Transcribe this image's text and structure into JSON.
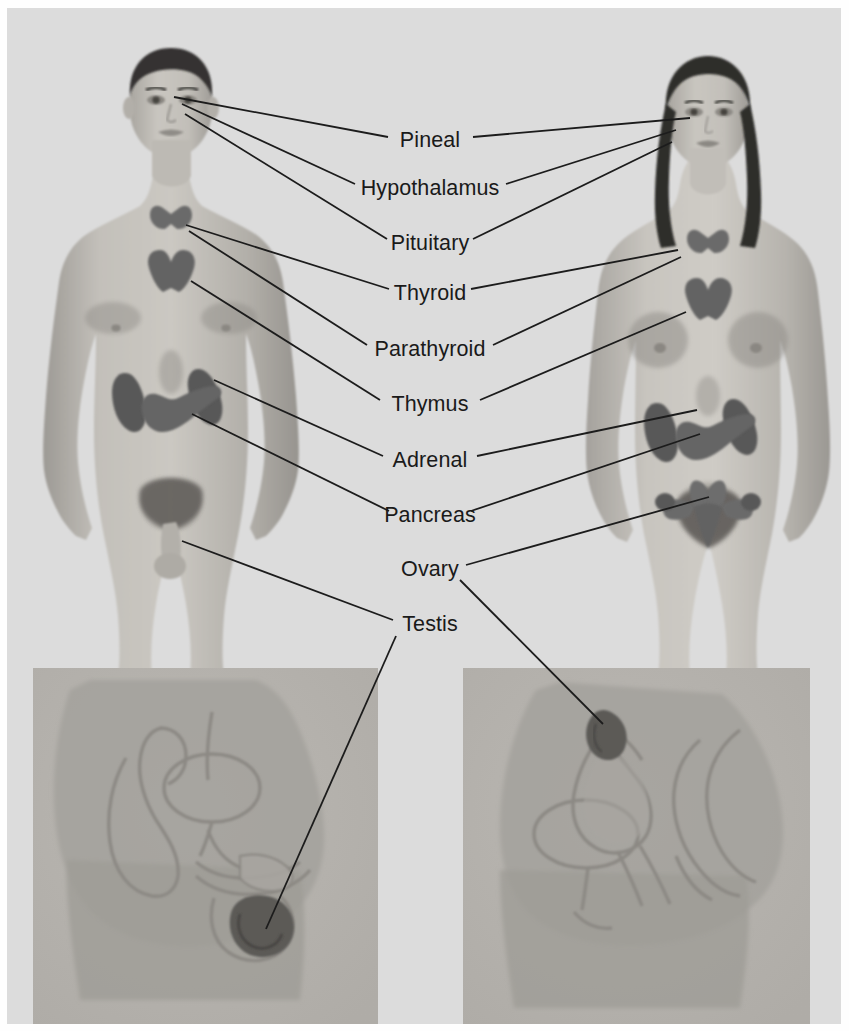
{
  "diagram": {
    "background_color": "#dcdcdc",
    "page_color": "#fefefe",
    "label_color": "#1a1a1a",
    "leader_line_color": "#1c1c1c",
    "organ_color": "#6a6a6a",
    "skin_color": "#b9b6b1",
    "inset_panel_color": "#b6b4b0",
    "hair_color": "#333230"
  },
  "labels": [
    {
      "id": "pineal",
      "text": "Pineal",
      "cx": 430,
      "cy": 141
    },
    {
      "id": "hypothalamus",
      "text": "Hypothalamus",
      "cx": 430,
      "cy": 189
    },
    {
      "id": "pituitary",
      "text": "Pituitary",
      "cx": 430,
      "cy": 244
    },
    {
      "id": "thyroid",
      "text": "Thyroid",
      "cx": 430,
      "cy": 294
    },
    {
      "id": "parathyroid",
      "text": "Parathyroid",
      "cx": 430,
      "cy": 350
    },
    {
      "id": "thymus",
      "text": "Thymus",
      "cx": 430,
      "cy": 405
    },
    {
      "id": "adrenal",
      "text": "Adrenal",
      "cx": 430,
      "cy": 461
    },
    {
      "id": "pancreas",
      "text": "Pancreas",
      "cx": 430,
      "cy": 516
    },
    {
      "id": "ovary",
      "text": "Ovary",
      "cx": 430,
      "cy": 570
    },
    {
      "id": "testis",
      "text": "Testis",
      "cx": 430,
      "cy": 625
    }
  ],
  "leader_lines": [
    {
      "id": "pineal-to-male",
      "label": "Pineal",
      "from": [
        388,
        137
      ],
      "to": [
        174,
        97
      ]
    },
    {
      "id": "pineal-to-female",
      "label": "Pineal",
      "from": [
        473,
        137
      ],
      "to": [
        690,
        118
      ]
    },
    {
      "id": "hypothalamus-to-male",
      "label": "Hypothalamus",
      "from": [
        355,
        184
      ],
      "to": [
        182,
        104
      ]
    },
    {
      "id": "hypothalamus-to-female",
      "label": "Hypothalamus",
      "from": [
        506,
        184
      ],
      "to": [
        676,
        130
      ]
    },
    {
      "id": "pituitary-to-male",
      "label": "Pituitary",
      "from": [
        387,
        239
      ],
      "to": [
        185,
        114
      ]
    },
    {
      "id": "pituitary-to-female",
      "label": "Pituitary",
      "from": [
        473,
        239
      ],
      "to": [
        672,
        142
      ]
    },
    {
      "id": "thyroid-to-male",
      "label": "Thyroid",
      "from": [
        389,
        289
      ],
      "to": [
        186,
        225
      ]
    },
    {
      "id": "thyroid-to-female",
      "label": "Thyroid",
      "from": [
        471,
        289
      ],
      "to": [
        678,
        250
      ]
    },
    {
      "id": "parathyroid-to-male",
      "label": "Parathyroid",
      "from": [
        367,
        345
      ],
      "to": [
        189,
        231
      ]
    },
    {
      "id": "parathyroid-to-female",
      "label": "Parathyroid",
      "from": [
        493,
        345
      ],
      "to": [
        681,
        257
      ]
    },
    {
      "id": "thymus-to-male",
      "label": "Thymus",
      "from": [
        380,
        400
      ],
      "to": [
        191,
        281
      ]
    },
    {
      "id": "thymus-to-female",
      "label": "Thymus",
      "from": [
        480,
        400
      ],
      "to": [
        686,
        312
      ]
    },
    {
      "id": "adrenal-to-male",
      "label": "Adrenal",
      "from": [
        383,
        456
      ],
      "to": [
        214,
        380
      ]
    },
    {
      "id": "adrenal-to-female",
      "label": "Adrenal",
      "from": [
        477,
        456
      ],
      "to": [
        697,
        410
      ]
    },
    {
      "id": "pancreas-to-male",
      "label": "Pancreas",
      "from": [
        389,
        511
      ],
      "to": [
        192,
        414
      ]
    },
    {
      "id": "pancreas-to-female",
      "label": "Pancreas",
      "from": [
        471,
        511
      ],
      "to": [
        700,
        434
      ]
    },
    {
      "id": "ovary-to-female-front",
      "label": "Ovary",
      "from": [
        466,
        565
      ],
      "to": [
        709,
        497
      ]
    },
    {
      "id": "ovary-to-female-inset",
      "label": "Ovary",
      "from": [
        460,
        580
      ],
      "to": [
        603,
        724
      ]
    },
    {
      "id": "testis-to-male-front",
      "label": "Testis",
      "from": [
        393,
        620
      ],
      "to": [
        182,
        541
      ]
    },
    {
      "id": "testis-to-male-inset",
      "label": "Testis",
      "from": [
        396,
        636
      ],
      "to": [
        266,
        929
      ]
    }
  ],
  "figures": [
    {
      "id": "male-anterior",
      "name": "Male anterior whole-body view",
      "glands": [
        "Thyroid",
        "Parathyroid",
        "Thymus",
        "Adrenal",
        "Pancreas",
        "Testis"
      ]
    },
    {
      "id": "female-anterior",
      "name": "Female anterior whole-body view",
      "glands": [
        "Thyroid",
        "Parathyroid",
        "Thymus",
        "Adrenal",
        "Pancreas",
        "Ovary"
      ]
    },
    {
      "id": "male-pelvis-inset",
      "name": "Male pelvic sagittal section inset",
      "glands": [
        "Testis"
      ]
    },
    {
      "id": "female-pelvis-inset",
      "name": "Female pelvic sagittal section inset",
      "glands": [
        "Ovary"
      ]
    }
  ]
}
